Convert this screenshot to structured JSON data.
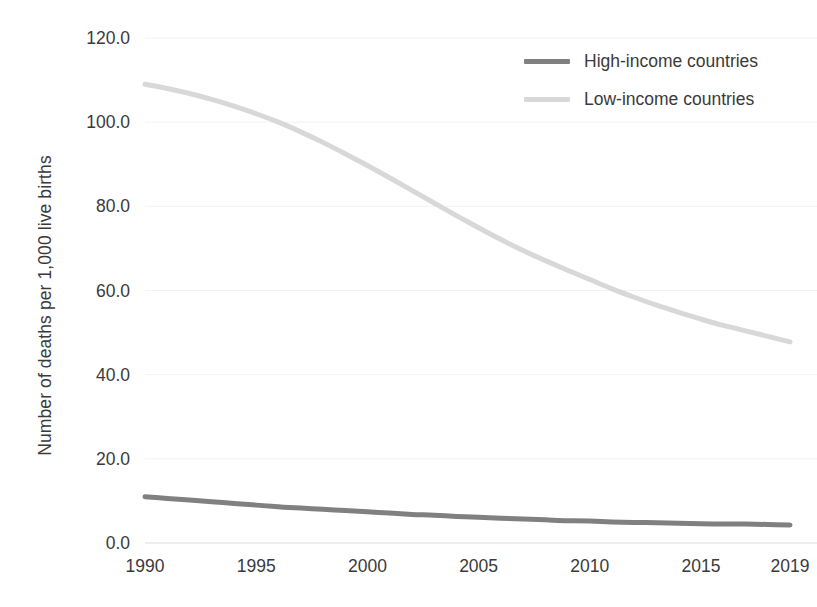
{
  "chart_data": {
    "type": "line",
    "title": "",
    "xlabel": "",
    "ylabel": "Number of deaths per 1,000 live births",
    "xlim": [
      1990,
      2019
    ],
    "ylim": [
      0.0,
      120.0
    ],
    "grid": "horizontal",
    "legend_position": "top-right-inside",
    "y_ticks": [
      "0.0",
      "20.0",
      "40.0",
      "60.0",
      "80.0",
      "100.0",
      "120.0"
    ],
    "y_tick_values": [
      0,
      20,
      40,
      60,
      80,
      100,
      120
    ],
    "x_ticks": [
      "1990",
      "1995",
      "2000",
      "2005",
      "2010",
      "2015",
      "2019"
    ],
    "x_tick_values": [
      1990,
      1995,
      2000,
      2005,
      2010,
      2015,
      2019
    ],
    "x": [
      1990,
      1991,
      1992,
      1993,
      1994,
      1995,
      1996,
      1997,
      1998,
      1999,
      2000,
      2001,
      2002,
      2003,
      2004,
      2005,
      2006,
      2007,
      2008,
      2009,
      2010,
      2011,
      2012,
      2013,
      2014,
      2015,
      2016,
      2017,
      2018,
      2019
    ],
    "series": [
      {
        "name": "High-income countries",
        "color": "#808080",
        "values": [
          11.0,
          10.6,
          10.2,
          9.8,
          9.4,
          9.0,
          8.6,
          8.3,
          8.0,
          7.7,
          7.4,
          7.1,
          6.8,
          6.6,
          6.3,
          6.1,
          5.9,
          5.7,
          5.5,
          5.3,
          5.2,
          5.0,
          4.9,
          4.8,
          4.7,
          4.6,
          4.5,
          4.5,
          4.4,
          4.3
        ]
      },
      {
        "name": "Low-income countries",
        "color": "#d8d8d8",
        "values": [
          109.0,
          108.0,
          106.8,
          105.4,
          103.8,
          102.0,
          100.0,
          97.7,
          95.2,
          92.5,
          89.7,
          86.8,
          83.8,
          80.8,
          77.8,
          74.9,
          72.1,
          69.5,
          67.1,
          64.8,
          62.6,
          60.4,
          58.4,
          56.5,
          54.8,
          53.2,
          51.7,
          50.4,
          49.1,
          47.8
        ]
      }
    ]
  },
  "legend": {
    "items": [
      {
        "label": "High-income countries",
        "color": "#808080"
      },
      {
        "label": "Low-income countries",
        "color": "#d8d8d8"
      }
    ]
  },
  "axes": {
    "y_title": "Number of deaths per 1,000 live births"
  },
  "cropped_title": ""
}
